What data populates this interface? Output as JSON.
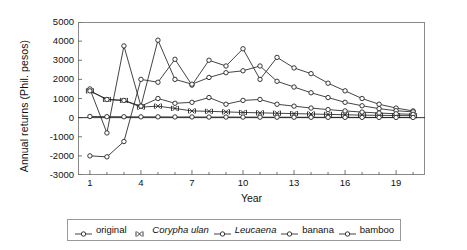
{
  "chart_data": {
    "type": "line",
    "title": "",
    "xlabel": "Year",
    "ylabel": "Annual returns (Phil. pesos)",
    "xlim": [
      0.3,
      20.7
    ],
    "ylim": [
      -3000,
      5000
    ],
    "grid": false,
    "legend_position": "bottom",
    "x": [
      1,
      2,
      3,
      4,
      5,
      6,
      7,
      8,
      9,
      10,
      11,
      12,
      13,
      14,
      15,
      16,
      17,
      18,
      19,
      20
    ],
    "xticks": [
      1,
      4,
      7,
      10,
      13,
      16,
      19
    ],
    "yticks": [
      5000,
      4000,
      3000,
      2000,
      1000,
      0,
      -1000,
      -2000,
      -3000
    ],
    "series": [
      {
        "name": "original",
        "marker": "open-circle",
        "values": [
          -2000,
          -2050,
          -1250,
          2000,
          1850,
          3050,
          1700,
          3000,
          2700,
          3600,
          2000,
          3150,
          2600,
          2300,
          1800,
          1400,
          1000,
          700,
          500,
          350
        ]
      },
      {
        "name": "Corypha ulan",
        "marker": "x",
        "italic": true,
        "values": [
          1400,
          950,
          900,
          550,
          600,
          480,
          350,
          330,
          300,
          270,
          250,
          230,
          210,
          190,
          170,
          150,
          130,
          120,
          110,
          100
        ]
      },
      {
        "name": "Leucaena",
        "marker": "open-circle",
        "italic": true,
        "values": [
          1500,
          -800,
          3750,
          600,
          4050,
          2000,
          1750,
          2100,
          2350,
          2450,
          2700,
          1900,
          1600,
          1300,
          1050,
          800,
          620,
          470,
          360,
          300
        ]
      },
      {
        "name": "banana",
        "marker": "open-circle",
        "values": [
          1400,
          950,
          900,
          600,
          1000,
          750,
          800,
          1050,
          700,
          900,
          950,
          700,
          600,
          500,
          420,
          350,
          290,
          240,
          200,
          170
        ]
      },
      {
        "name": "bamboo",
        "marker": "open-circle",
        "values": [
          60,
          50,
          45,
          40,
          40,
          35,
          35,
          30,
          30,
          28,
          25,
          22,
          20,
          18,
          16,
          14,
          12,
          10,
          9,
          8
        ]
      }
    ]
  },
  "legend": {
    "items": [
      {
        "label": "original",
        "italic": false
      },
      {
        "label": "Corypha ulan",
        "italic": true
      },
      {
        "label": "Leucaena",
        "italic": true
      },
      {
        "label": "banana",
        "italic": false
      },
      {
        "label": "bamboo",
        "italic": false
      }
    ]
  }
}
